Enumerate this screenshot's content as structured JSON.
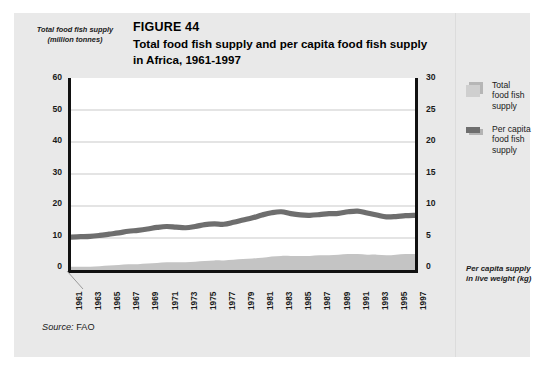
{
  "figure": {
    "number": "FIGURE 44",
    "title_line1": "Total food fish supply and per capita food fish supply",
    "title_line2": "in Africa, 1961-1997",
    "source_label": "Source:",
    "source_value": "FAO"
  },
  "legend": {
    "items": [
      {
        "label_line1": "Total",
        "label_line2": "food fish",
        "label_line3": "supply",
        "swatch": "stacked-square-swatch",
        "color": "#cfcfcf"
      },
      {
        "label_line1": "Per capita",
        "label_line2": "food fish",
        "label_line3": "supply",
        "swatch": "thick-line-swatch",
        "color": "#6e6e6e"
      }
    ]
  },
  "axes": {
    "left_label_line1": "Total food fish supply",
    "left_label_line2": "(million tonnes)",
    "right_label_line1": "Per capita supply",
    "right_label_line2": "in live weight (kg)",
    "left_ticks": [
      "60",
      "50",
      "40",
      "30",
      "20",
      "10",
      "0"
    ],
    "right_ticks": [
      "30",
      "25",
      "20",
      "15",
      "10",
      "5",
      "0"
    ],
    "year_ticks": [
      "1961",
      "1963",
      "1965",
      "1967",
      "1969",
      "1971",
      "1973",
      "1975",
      "1977",
      "1979",
      "1981",
      "1983",
      "1985",
      "1987",
      "1989",
      "1991",
      "1993",
      "1995",
      "1997"
    ]
  },
  "chart_data": {
    "type": "line",
    "title": "Total food fish supply and per capita food fish supply in Africa, 1961-1997",
    "xlabel": "",
    "ylabel": "Total food fish supply (million tonnes)",
    "ylabel_secondary": "Per capita supply in live weight (kg)",
    "ylim": [
      0,
      60
    ],
    "ylim_secondary": [
      0,
      30
    ],
    "grid": true,
    "legend_position": "right",
    "x": [
      1961,
      1962,
      1963,
      1964,
      1965,
      1966,
      1967,
      1968,
      1969,
      1970,
      1971,
      1972,
      1973,
      1974,
      1975,
      1976,
      1977,
      1978,
      1979,
      1980,
      1981,
      1982,
      1983,
      1984,
      1985,
      1986,
      1987,
      1988,
      1989,
      1990,
      1991,
      1992,
      1993,
      1994,
      1995,
      1996,
      1997
    ],
    "series": [
      {
        "name": "Total food fish supply",
        "axis": "left",
        "units": "million tonnes",
        "render": "thick-line",
        "color": "#6e6e6e",
        "values": [
          10.3,
          10.4,
          10.5,
          10.8,
          11.2,
          11.6,
          12.1,
          12.4,
          12.8,
          13.3,
          13.6,
          13.4,
          13.2,
          13.6,
          14.2,
          14.4,
          14.3,
          14.9,
          15.6,
          16.3,
          17.2,
          17.9,
          18.2,
          17.6,
          17.2,
          17.1,
          17.3,
          17.6,
          17.7,
          18.2,
          18.4,
          17.8,
          17.2,
          16.6,
          16.7,
          17.0,
          17.1
        ]
      },
      {
        "name": "Per capita food fish supply",
        "axis": "right",
        "units": "kg",
        "render": "filled-area",
        "color": "#c4c4c4",
        "values": [
          0.5,
          0.5,
          0.5,
          0.6,
          0.7,
          0.8,
          0.9,
          0.9,
          1.0,
          1.1,
          1.2,
          1.2,
          1.2,
          1.3,
          1.4,
          1.5,
          1.5,
          1.6,
          1.7,
          1.8,
          1.9,
          2.1,
          2.2,
          2.2,
          2.2,
          2.2,
          2.3,
          2.3,
          2.4,
          2.5,
          2.5,
          2.4,
          2.4,
          2.3,
          2.4,
          2.5,
          2.5
        ]
      }
    ]
  }
}
